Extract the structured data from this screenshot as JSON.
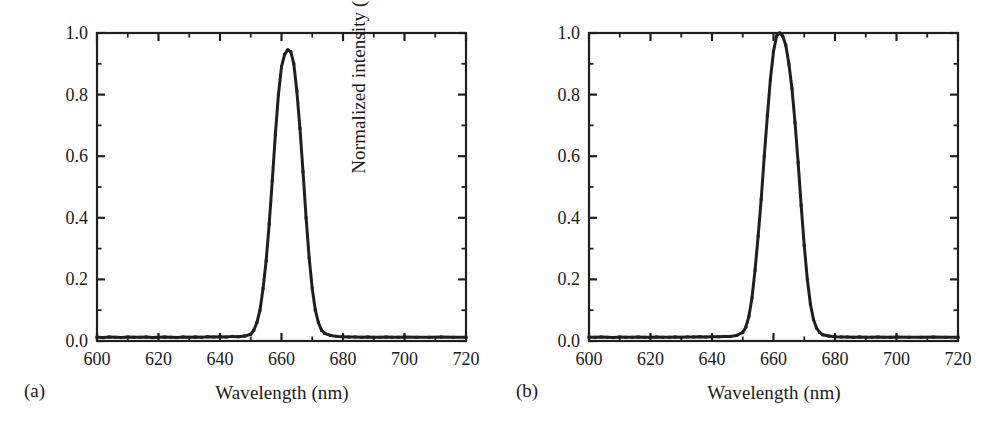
{
  "figure": {
    "background": "#ffffff",
    "ink_color": "#1f1f1f",
    "panels": [
      {
        "tag": "(a)",
        "xlabel": "Wavelength (nm)",
        "ylabel": "Normalized intensity (a.u.)"
      },
      {
        "tag": "(b)",
        "xlabel": "Wavelength (nm)",
        "ylabel": "Normalized intensity (a.u.)"
      }
    ]
  },
  "chart_data": [
    {
      "type": "line",
      "panel": "(a)",
      "title": "",
      "xlabel": "Wavelength (nm)",
      "ylabel": "Normalized intensity (a.u.)",
      "xlim": [
        600,
        720
      ],
      "ylim": [
        0.0,
        1.0
      ],
      "xticks": [
        600,
        620,
        640,
        660,
        680,
        700,
        720
      ],
      "xtick_labels": [
        "600",
        "620",
        "640",
        "660",
        "680",
        "700",
        "720"
      ],
      "x_minor_tick_step": 10,
      "yticks": [
        0.0,
        0.2,
        0.4,
        0.6,
        0.8,
        1.0
      ],
      "ytick_labels": [
        "0.0",
        "0.2",
        "0.4",
        "0.6",
        "0.8",
        "1.0"
      ],
      "y_minor_tick_step": 0.1,
      "grid": false,
      "legend": null,
      "peak_center_nm": 662.5,
      "peak_height": 0.945,
      "fwhm_nm": 8.8,
      "baseline": 0.012,
      "marker": "square",
      "x": [
        600,
        602,
        604,
        606,
        608,
        610,
        612,
        614,
        616,
        618,
        620,
        622,
        624,
        626,
        628,
        630,
        632,
        634,
        636,
        638,
        640,
        642,
        644,
        646,
        648,
        650,
        651,
        652,
        653,
        654,
        655,
        656,
        657,
        658,
        659,
        660,
        661,
        662,
        663,
        664,
        665,
        666,
        667,
        668,
        669,
        670,
        671,
        672,
        673,
        674,
        676,
        678,
        680,
        682,
        684,
        686,
        688,
        690,
        692,
        694,
        696,
        698,
        700,
        704,
        708,
        712,
        716,
        720
      ],
      "y": [
        0.012,
        0.011,
        0.013,
        0.012,
        0.011,
        0.013,
        0.012,
        0.012,
        0.013,
        0.011,
        0.012,
        0.013,
        0.012,
        0.011,
        0.013,
        0.012,
        0.013,
        0.012,
        0.014,
        0.013,
        0.014,
        0.013,
        0.015,
        0.014,
        0.016,
        0.022,
        0.035,
        0.06,
        0.1,
        0.17,
        0.26,
        0.38,
        0.52,
        0.67,
        0.8,
        0.89,
        0.93,
        0.945,
        0.94,
        0.9,
        0.81,
        0.69,
        0.55,
        0.4,
        0.27,
        0.17,
        0.1,
        0.06,
        0.035,
        0.025,
        0.018,
        0.015,
        0.014,
        0.013,
        0.013,
        0.012,
        0.013,
        0.012,
        0.012,
        0.013,
        0.012,
        0.012,
        0.013,
        0.012,
        0.012,
        0.013,
        0.012,
        0.012
      ]
    },
    {
      "type": "line",
      "panel": "(b)",
      "title": "",
      "xlabel": "Wavelength (nm)",
      "ylabel": "Normalized intensity (a.u.)",
      "xlim": [
        600,
        720
      ],
      "ylim": [
        0.0,
        1.0
      ],
      "xticks": [
        600,
        620,
        640,
        660,
        680,
        700,
        720
      ],
      "xtick_labels": [
        "600",
        "620",
        "640",
        "660",
        "680",
        "700",
        "720"
      ],
      "x_minor_tick_step": 10,
      "yticks": [
        0.0,
        0.2,
        0.4,
        0.6,
        0.8,
        1.0
      ],
      "ytick_labels": [
        "0.0",
        "0.2",
        "0.4",
        "0.6",
        "0.8",
        "1.0"
      ],
      "y_minor_tick_step": 0.1,
      "grid": false,
      "legend": null,
      "peak_center_nm": 662.0,
      "peak_height": 1.0,
      "fwhm_nm": 9.6,
      "baseline": 0.012,
      "marker": "square",
      "x": [
        600,
        602,
        604,
        606,
        608,
        610,
        612,
        614,
        616,
        618,
        620,
        622,
        624,
        626,
        628,
        630,
        632,
        634,
        636,
        638,
        640,
        642,
        644,
        646,
        648,
        650,
        651,
        652,
        653,
        654,
        655,
        656,
        657,
        658,
        659,
        660,
        661,
        662,
        663,
        664,
        665,
        666,
        667,
        668,
        669,
        670,
        671,
        672,
        673,
        674,
        675,
        676,
        678,
        680,
        682,
        684,
        686,
        688,
        690,
        692,
        694,
        696,
        698,
        700,
        704,
        708,
        712,
        716,
        720
      ],
      "y": [
        0.012,
        0.012,
        0.013,
        0.012,
        0.011,
        0.013,
        0.012,
        0.012,
        0.013,
        0.012,
        0.012,
        0.013,
        0.012,
        0.012,
        0.013,
        0.012,
        0.013,
        0.013,
        0.014,
        0.013,
        0.014,
        0.014,
        0.015,
        0.015,
        0.018,
        0.028,
        0.045,
        0.08,
        0.14,
        0.23,
        0.34,
        0.46,
        0.6,
        0.73,
        0.85,
        0.94,
        0.99,
        1.0,
        0.99,
        0.96,
        0.9,
        0.82,
        0.71,
        0.58,
        0.44,
        0.31,
        0.2,
        0.12,
        0.07,
        0.042,
        0.028,
        0.02,
        0.016,
        0.014,
        0.013,
        0.013,
        0.012,
        0.013,
        0.012,
        0.012,
        0.013,
        0.012,
        0.012,
        0.013,
        0.012,
        0.012,
        0.013,
        0.012,
        0.012
      ]
    }
  ]
}
